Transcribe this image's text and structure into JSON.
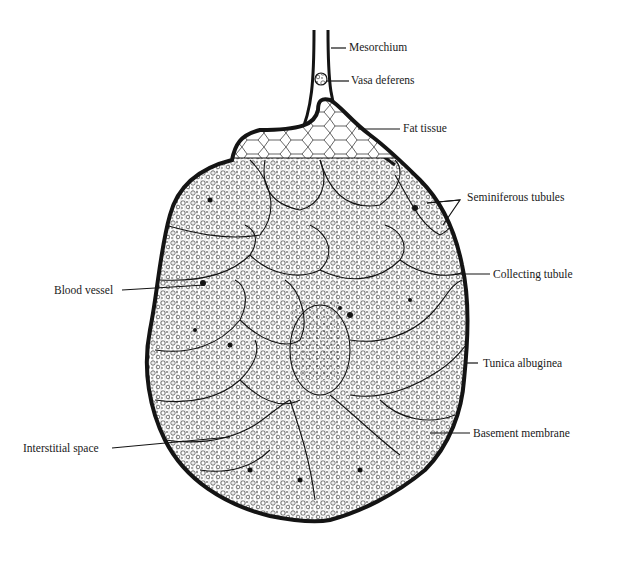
{
  "figure": {
    "labels": {
      "mesorchium": "Mesorchium",
      "vasa_deferens": "Vasa deferens",
      "fat_tissue": "Fat tissue",
      "seminiferous_tubules": "Seminiferous tubules",
      "collecting_tubule": "Collecting tubule",
      "blood_vessel": "Blood vessel",
      "tunica_albuginea": "Tunica albuginea",
      "interstitial_space": "Interstitial space",
      "basement_membrane": "Basement membrane"
    },
    "colors": {
      "ink": "#141414",
      "background": "#ffffff"
    }
  }
}
